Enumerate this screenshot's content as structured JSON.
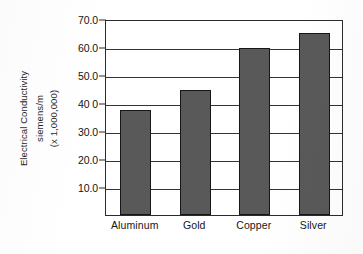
{
  "chart_data": {
    "type": "bar",
    "title": "",
    "subtitle": "",
    "xlabel": "",
    "ylabel": "Electrical Conductivity siemens/m (x 1,000,000)",
    "ylabel_lines": [
      "Electrical Conductivity",
      "siemens/m",
      "(x 1,000,000)"
    ],
    "categories": [
      "Aluminum",
      "Gold",
      "Copper",
      "Silver"
    ],
    "values": [
      37.5,
      44.5,
      59.5,
      65.0
    ],
    "series": [
      {
        "name": "Electrical Conductivity",
        "values": [
          37.5,
          44.5,
          59.5,
          65.0
        ]
      }
    ],
    "ylim": [
      0,
      70
    ],
    "ytick_labels": [
      "70.0",
      "60.0",
      "50.0",
      "40 0",
      "30.0",
      "20.0",
      "10.0"
    ],
    "ytick_values": [
      70,
      60,
      50,
      40,
      30,
      20,
      10
    ],
    "ytick_step": 10,
    "grid": "horizontal",
    "legend": "none",
    "bar_color": "#595959",
    "bar_edge_color": "#171717",
    "axis_color": "#2b2b2b",
    "grid_color": "#343434",
    "background_color": "#ffffff",
    "annotations": []
  }
}
